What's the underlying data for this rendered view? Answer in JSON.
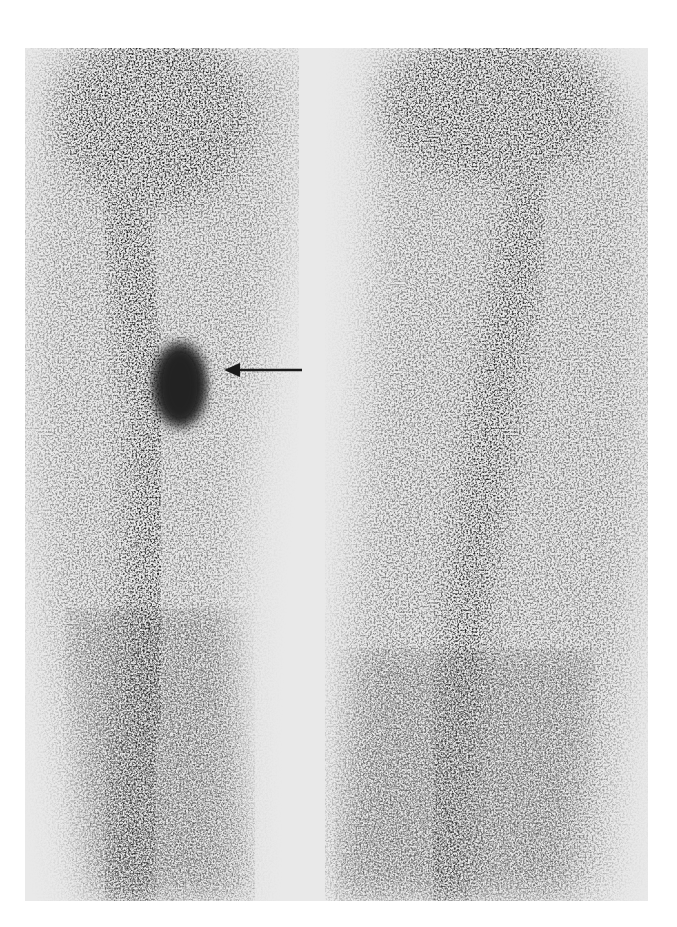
{
  "figure": {
    "type": "scintigraphy-scan",
    "background_color": "#ffffff",
    "panel_color": "#e9e9e9",
    "ink_color": "#2a2a2a",
    "regions": [
      {
        "name": "left-limb-uptake",
        "description": "elongated band of tracer uptake, dense at top"
      },
      {
        "name": "focal-hot-spot",
        "description": "oval focus of intense uptake on left limb"
      },
      {
        "name": "right-limb-uptake",
        "description": "elongated band of tracer uptake"
      }
    ],
    "annotations": [
      {
        "name": "arrow",
        "points_to": "focal-hot-spot",
        "direction": "left"
      }
    ]
  }
}
